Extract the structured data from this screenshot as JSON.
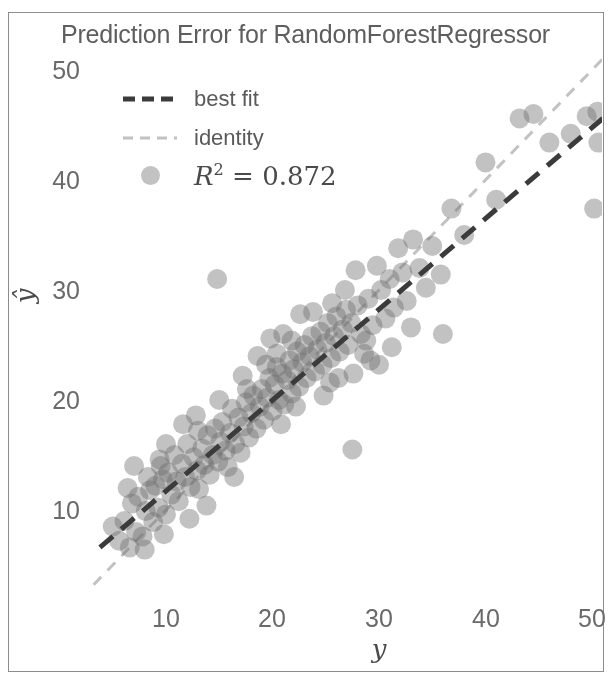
{
  "figure": {
    "title": "Prediction Error for RandomForestRegressor",
    "background": "#ffffff",
    "frame_color": "#8d8d8d"
  },
  "axes": {
    "xlabel": "y",
    "ylabel": "ŷ",
    "xticks": [
      "10",
      "20",
      "30",
      "40",
      "50"
    ],
    "yticks": [
      "10",
      "20",
      "30",
      "40",
      "50"
    ]
  },
  "legend": {
    "entries": [
      {
        "label": "best fit",
        "kind": "dashed-line",
        "color": "#3b3b3b"
      },
      {
        "label": "identity",
        "kind": "dashed-line",
        "color": "#c2c2c2"
      },
      {
        "label": "R^2 = 0.872",
        "kind": "marker",
        "color": "#6e6e6e",
        "r2_symbol": "R",
        "r2_exponent": "2",
        "r2_equals": " = ",
        "r2_value": "0.872"
      }
    ]
  },
  "chart_data": {
    "type": "scatter",
    "title": "Prediction Error for RandomForestRegressor",
    "xlabel": "y",
    "ylabel": "ŷ",
    "xlim": [
      3.0,
      51.5
    ],
    "ylim": [
      3.0,
      52.0
    ],
    "xticks": [
      10,
      20,
      30,
      40,
      50
    ],
    "yticks": [
      10,
      20,
      30,
      40,
      50
    ],
    "grid": false,
    "legend_position": "upper left",
    "r_squared": 0.872,
    "marker": {
      "shape": "circle",
      "radius_px": 10,
      "color": "#6e6e6e",
      "alpha": 0.42
    },
    "lines": [
      {
        "name": "best fit",
        "style": "dashed",
        "color": "#3b3b3b",
        "width_px": 5,
        "x": [
          3.8,
          51.5
        ],
        "y": [
          6.6,
          46.0
        ]
      },
      {
        "name": "identity",
        "style": "dashed",
        "color": "#c2c2c2",
        "width_px": 3,
        "x": [
          3.2,
          52.0
        ],
        "y": [
          3.2,
          52.0
        ]
      }
    ],
    "points": [
      [
        5.0,
        8.5
      ],
      [
        5.6,
        7.2
      ],
      [
        6.1,
        9.0
      ],
      [
        6.6,
        6.6
      ],
      [
        6.8,
        10.6
      ],
      [
        7.2,
        8.0
      ],
      [
        7.4,
        11.2
      ],
      [
        7.8,
        7.6
      ],
      [
        8.1,
        9.9
      ],
      [
        8.3,
        13.0
      ],
      [
        8.5,
        11.8
      ],
      [
        8.8,
        8.9
      ],
      [
        9.0,
        12.2
      ],
      [
        9.3,
        10.2
      ],
      [
        9.5,
        14.0
      ],
      [
        9.7,
        12.8
      ],
      [
        10.0,
        9.6
      ],
      [
        10.2,
        13.4
      ],
      [
        10.5,
        11.4
      ],
      [
        10.8,
        15.0
      ],
      [
        11.0,
        12.6
      ],
      [
        11.2,
        10.8
      ],
      [
        11.5,
        14.2
      ],
      [
        11.8,
        13.0
      ],
      [
        12.0,
        16.0
      ],
      [
        12.3,
        12.1
      ],
      [
        12.6,
        14.8
      ],
      [
        12.9,
        13.6
      ],
      [
        13.1,
        11.9
      ],
      [
        13.4,
        15.6
      ],
      [
        13.6,
        14.1
      ],
      [
        13.9,
        16.8
      ],
      [
        14.1,
        13.2
      ],
      [
        14.4,
        15.0
      ],
      [
        14.6,
        17.4
      ],
      [
        14.9,
        14.4
      ],
      [
        15.1,
        16.2
      ],
      [
        15.3,
        18.0
      ],
      [
        15.6,
        15.4
      ],
      [
        15.8,
        13.9
      ],
      [
        16.0,
        17.0
      ],
      [
        16.2,
        19.2
      ],
      [
        16.5,
        16.0
      ],
      [
        16.8,
        18.4
      ],
      [
        17.0,
        15.2
      ],
      [
        17.3,
        17.6
      ],
      [
        17.5,
        19.8
      ],
      [
        17.8,
        16.6
      ],
      [
        18.0,
        18.8
      ],
      [
        18.2,
        20.4
      ],
      [
        18.5,
        17.4
      ],
      [
        18.8,
        19.4
      ],
      [
        19.0,
        21.0
      ],
      [
        19.2,
        18.2
      ],
      [
        19.5,
        20.2
      ],
      [
        19.7,
        22.0
      ],
      [
        20.0,
        19.0
      ],
      [
        20.2,
        21.4
      ],
      [
        20.4,
        23.0
      ],
      [
        20.6,
        20.0
      ],
      [
        20.9,
        22.4
      ],
      [
        21.1,
        19.6
      ],
      [
        21.4,
        21.8
      ],
      [
        21.6,
        23.6
      ],
      [
        21.8,
        20.6
      ],
      [
        22.0,
        22.8
      ],
      [
        22.3,
        24.4
      ],
      [
        22.5,
        21.2
      ],
      [
        22.8,
        23.4
      ],
      [
        23.0,
        25.0
      ],
      [
        23.2,
        22.0
      ],
      [
        23.5,
        24.0
      ],
      [
        23.7,
        25.8
      ],
      [
        24.0,
        22.6
      ],
      [
        24.2,
        24.6
      ],
      [
        24.5,
        26.2
      ],
      [
        24.7,
        23.2
      ],
      [
        25.0,
        25.2
      ],
      [
        25.2,
        27.0
      ],
      [
        25.5,
        23.8
      ],
      [
        25.8,
        25.8
      ],
      [
        26.0,
        27.6
      ],
      [
        26.3,
        24.4
      ],
      [
        26.6,
        26.4
      ],
      [
        26.9,
        28.2
      ],
      [
        27.1,
        25.0
      ],
      [
        27.4,
        27.0
      ],
      [
        27.6,
        22.4
      ],
      [
        27.5,
        15.5
      ],
      [
        28.0,
        28.6
      ],
      [
        28.3,
        26.0
      ],
      [
        28.6,
        24.2
      ],
      [
        29.0,
        29.2
      ],
      [
        29.4,
        26.8
      ],
      [
        29.8,
        32.2
      ],
      [
        30.2,
        30.0
      ],
      [
        30.6,
        27.4
      ],
      [
        31.0,
        31.0
      ],
      [
        31.4,
        28.4
      ],
      [
        31.8,
        33.8
      ],
      [
        32.2,
        31.6
      ],
      [
        32.6,
        29.0
      ],
      [
        33.2,
        34.6
      ],
      [
        33.8,
        32.0
      ],
      [
        34.4,
        30.2
      ],
      [
        35.0,
        34.0
      ],
      [
        36.0,
        26.0
      ],
      [
        36.8,
        37.4
      ],
      [
        38.0,
        35.0
      ],
      [
        40.0,
        41.6
      ],
      [
        41.0,
        38.2
      ],
      [
        43.2,
        45.6
      ],
      [
        44.5,
        46.0
      ],
      [
        46.0,
        43.4
      ],
      [
        48.0,
        44.2
      ],
      [
        49.5,
        45.8
      ],
      [
        50.5,
        46.2
      ],
      [
        50.6,
        43.4
      ],
      [
        50.2,
        37.4
      ],
      [
        14.8,
        31.0
      ],
      [
        27.8,
        31.8
      ],
      [
        35.8,
        31.4
      ],
      [
        9.4,
        14.6
      ],
      [
        12.8,
        18.6
      ],
      [
        18.6,
        24.0
      ],
      [
        22.2,
        19.4
      ],
      [
        25.4,
        21.6
      ],
      [
        29.2,
        23.6
      ],
      [
        6.4,
        12.0
      ],
      [
        7.0,
        14.0
      ],
      [
        19.8,
        25.6
      ],
      [
        21.0,
        26.0
      ],
      [
        23.8,
        28.0
      ],
      [
        17.2,
        22.2
      ],
      [
        15.0,
        20.0
      ],
      [
        13.0,
        17.2
      ],
      [
        26.2,
        22.0
      ],
      [
        28.8,
        25.4
      ],
      [
        11.6,
        17.8
      ],
      [
        10.0,
        16.0
      ],
      [
        20.8,
        17.8
      ],
      [
        24.8,
        20.4
      ],
      [
        8.0,
        6.4
      ],
      [
        9.8,
        7.8
      ],
      [
        12.2,
        9.2
      ],
      [
        13.8,
        10.4
      ],
      [
        16.4,
        13.0
      ],
      [
        31.2,
        24.8
      ],
      [
        33.0,
        26.6
      ],
      [
        30.0,
        23.2
      ],
      [
        22.6,
        27.8
      ],
      [
        19.4,
        23.2
      ],
      [
        17.6,
        21.0
      ],
      [
        25.6,
        28.8
      ],
      [
        26.8,
        30.0
      ],
      [
        21.8,
        25.4
      ],
      [
        20.4,
        24.2
      ]
    ]
  }
}
